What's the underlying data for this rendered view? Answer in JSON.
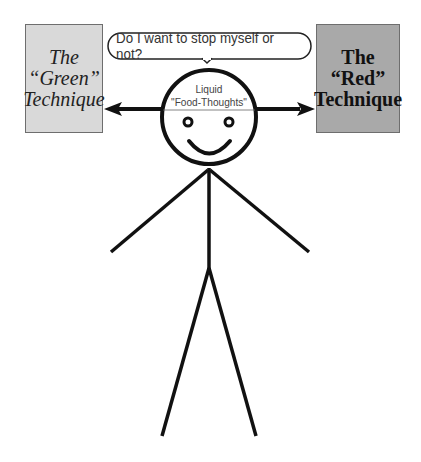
{
  "diagram": {
    "left_box": {
      "lines": [
        "The",
        "“Green”",
        "Technique"
      ],
      "fill": "#d9d9d9"
    },
    "right_box": {
      "lines": [
        "The",
        "“Red”",
        "Technique"
      ],
      "fill": "#a9a9a9"
    },
    "speech_bubble": {
      "text": "Do I want to stop myself or not?"
    },
    "head_label": {
      "lines": [
        "Liquid",
        "\"Food-Thoughts\""
      ]
    },
    "arrows": [
      "left-to-green-technique",
      "right-to-red-technique"
    ],
    "figure": "stick-figure-smiling"
  }
}
